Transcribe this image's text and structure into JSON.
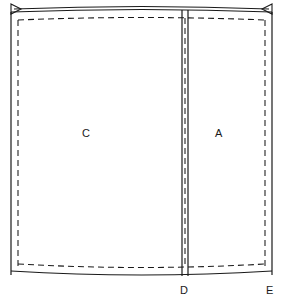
{
  "diagram": {
    "background_color": "#ffffff",
    "line_color": "#1a1a1a",
    "stroke_width": 1.2,
    "dash_pattern": "6,4",
    "panels": [
      {
        "id": "C",
        "label": "C",
        "position": "left"
      },
      {
        "id": "A",
        "label": "A",
        "position": "right"
      }
    ],
    "point_markers": [
      {
        "id": "D",
        "label": "D",
        "position": "bottom-center"
      },
      {
        "id": "E",
        "label": "E",
        "position": "bottom-right"
      }
    ],
    "outline": {
      "name": "cut-line",
      "style": "solid",
      "left_x": 11,
      "right_x": 272,
      "top_y": 11,
      "bottom_y": 275,
      "top_curve_rise": 4,
      "bottom_curve_drop": 5
    },
    "stitch_line": {
      "name": "seam-allowance-line",
      "style": "dashed",
      "inset": 7
    },
    "center_seam": {
      "name": "center-fold-seam",
      "left_line_x": 182,
      "right_line_x": 188,
      "dashed_line_x": 185,
      "style": "solid-pair-with-dashed-center"
    },
    "dimension_line": {
      "name": "top-width-dimension",
      "style": "solid-with-arrowheads",
      "arrow_left": "arrow-left-head",
      "arrow_right": "arrow-right-head",
      "y": 9
    }
  }
}
